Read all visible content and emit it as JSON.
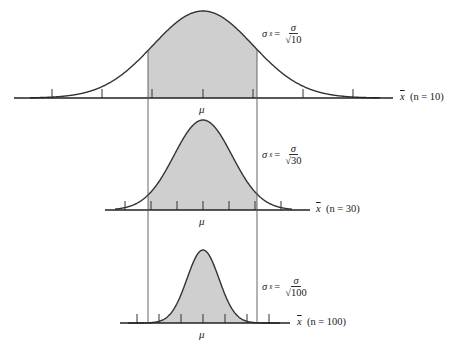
{
  "diagram": {
    "type": "sampling-distribution-comparison",
    "shade_color": "#cfcfcf",
    "line_color": "#333333",
    "center_label": "μ",
    "panels": [
      {
        "n": 10,
        "axis_label_var": "x",
        "axis_label_n": "(n = 10)",
        "sigma_lhs": "σ",
        "sigma_sub": "x̄",
        "sigma_num": "σ",
        "sigma_den": "√10",
        "axis_y": 98,
        "peak_y": 11,
        "sigma_px": 50,
        "axis_x0": 14,
        "axis_x1": 393,
        "curve_x0": 30,
        "curve_x1": 380,
        "ticks": [
          52,
          102,
          152,
          203,
          253,
          303,
          353
        ]
      },
      {
        "n": 30,
        "axis_label_var": "x",
        "axis_label_n": "(n = 30)",
        "sigma_lhs": "σ",
        "sigma_sub": "x̄",
        "sigma_num": "σ",
        "sigma_den": "√30",
        "axis_y": 210,
        "peak_y": 120,
        "sigma_px": 29,
        "axis_x0": 105,
        "axis_x1": 310,
        "curve_x0": 115,
        "curve_x1": 292,
        "ticks": [
          125,
          151,
          177,
          203,
          229,
          255,
          281
        ]
      },
      {
        "n": 100,
        "axis_label_var": "x",
        "axis_label_n": "(n = 100)",
        "sigma_lhs": "σ",
        "sigma_sub": "x̄",
        "sigma_num": "σ",
        "sigma_den": "√100",
        "axis_y": 323,
        "peak_y": 250,
        "sigma_px": 16,
        "axis_x0": 120,
        "axis_x1": 290,
        "curve_x0": 128,
        "curve_x1": 280,
        "ticks": [
          137,
          159,
          181,
          203,
          225,
          247,
          269
        ]
      }
    ],
    "mu_x": 203,
    "bounds": {
      "left_x": 148,
      "right_x": 257,
      "top_y": 98,
      "bottom_y": 323
    }
  }
}
